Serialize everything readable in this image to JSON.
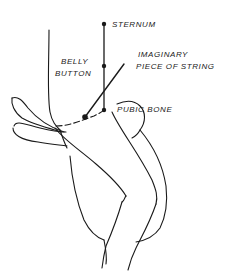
{
  "diagram": {
    "title": "",
    "labels": {
      "sternum": "STERNUM",
      "belly_button_line1": "BELLY",
      "belly_button_line2": "BUTTON",
      "string_line1": "IMAGINARY",
      "string_line2": "PIECE OF STRING",
      "pubic_bone": "PUBIC BONE"
    },
    "points": {
      "sternum": [
        104,
        24
      ],
      "belly_button": [
        104,
        66
      ],
      "pubic_bone": [
        104,
        110
      ],
      "string_start": [
        85,
        117
      ],
      "string_end": [
        124,
        64
      ]
    },
    "colors": {
      "ink": "#1a1a1a",
      "background": "#ffffff"
    }
  }
}
